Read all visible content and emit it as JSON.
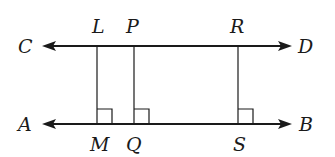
{
  "diagram": {
    "type": "parallel-lines-with-perpendiculars",
    "lines": [
      {
        "name": "line-CD",
        "left_label": "C",
        "right_label": "D"
      },
      {
        "name": "line-AB",
        "left_label": "A",
        "right_label": "B"
      }
    ],
    "perpendiculars": [
      {
        "top_label": "L",
        "bottom_label": "M",
        "right_angle": true
      },
      {
        "top_label": "P",
        "bottom_label": "Q",
        "right_angle": true
      },
      {
        "top_label": "R",
        "bottom_label": "S",
        "right_angle": true
      }
    ],
    "labels": {
      "C": "C",
      "D": "D",
      "A": "A",
      "B": "B",
      "L": "L",
      "P": "P",
      "R": "R",
      "M": "M",
      "Q": "Q",
      "S": "S"
    }
  }
}
